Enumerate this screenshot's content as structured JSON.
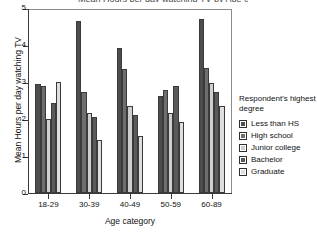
{
  "chart_data": {
    "type": "bar",
    "title": "Mean Hours per day watching TV by Age category",
    "xlabel": "Age category",
    "ylabel": "Mean Hours per day watching TV",
    "categories": [
      "18-29",
      "30-39",
      "40-49",
      "50-59",
      "60-89"
    ],
    "ylim": [
      0,
      5
    ],
    "yticks": [
      "0",
      "1",
      "2",
      "3",
      "4",
      "5"
    ],
    "grid": false,
    "legend_position": "right",
    "legend_title": "Respondent's highest degree",
    "series": [
      {
        "name": "Less than HS",
        "color": "#4d4d4d",
        "values": [
          2.95,
          4.65,
          3.92,
          2.61,
          4.71
        ]
      },
      {
        "name": "High school",
        "color": "#6e6e6e",
        "values": [
          2.88,
          2.74,
          3.34,
          2.79,
          3.37
        ]
      },
      {
        "name": "Junior college",
        "color": "#cfcfcf",
        "values": [
          2.0,
          2.17,
          2.36,
          2.17,
          2.98
        ]
      },
      {
        "name": "Bachelor",
        "color": "#5a5a5a",
        "values": [
          2.43,
          2.05,
          2.11,
          2.89,
          2.74
        ]
      },
      {
        "name": "Graduate",
        "color": "#dedede",
        "values": [
          3.0,
          1.44,
          1.55,
          1.92,
          2.34
        ]
      }
    ]
  }
}
